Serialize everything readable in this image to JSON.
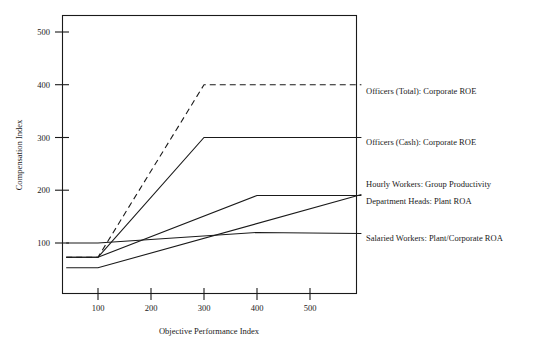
{
  "chart_data": {
    "type": "line",
    "title": "",
    "xlabel": "Objective Performance Index",
    "ylabel": "Compensation Index",
    "xlim": [
      40,
      597
    ],
    "ylim": [
      0,
      540
    ],
    "xticks": [
      100,
      200,
      300,
      400,
      500
    ],
    "xtick_labels": [
      "100",
      "200",
      "300",
      "400",
      "500"
    ],
    "yticks": [
      100,
      200,
      300,
      400,
      500
    ],
    "ytick_labels": [
      "100",
      "200",
      "300",
      "400",
      "500"
    ],
    "grid": false,
    "legend_position": "right-of-axes",
    "series": [
      {
        "name": "Officers (Total): Corporate ROE",
        "style": "dashed",
        "label": "Officers (Total): Corporate ROE",
        "x": [
          40,
          100,
          300,
          597
        ],
        "y": [
          73,
          73,
          400,
          400
        ]
      },
      {
        "name": "Officers (Cash): Corporate ROE",
        "style": "solid",
        "label": "Officers (Cash): Corporate ROE",
        "x": [
          40,
          100,
          300,
          597
        ],
        "y": [
          73,
          73,
          300,
          300
        ]
      },
      {
        "name": "Hourly Workers: Group Productivity",
        "style": "solid",
        "label": "Hourly Workers: Group Productivity",
        "x": [
          40,
          100,
          597
        ],
        "y": [
          53,
          53,
          192
        ]
      },
      {
        "name": "Department Heads: Plant ROA",
        "style": "solid",
        "label": "Department Heads: Plant ROA",
        "x": [
          40,
          100,
          400,
          597
        ],
        "y": [
          73,
          73,
          190,
          190
        ]
      },
      {
        "name": "Salaried Workers: Plant/Corporate ROA",
        "style": "solid",
        "label": "Salaried Workers: Plant/Corporate ROA",
        "x": [
          40,
          100,
          400,
          597
        ],
        "y": [
          100,
          100,
          120,
          118
        ]
      }
    ],
    "series_label_positions": [
      {
        "label_y": 91
      },
      {
        "label_y": 142
      },
      {
        "label_y": 184
      },
      {
        "label_y": 201
      },
      {
        "label_y": 238
      }
    ]
  },
  "colors": {
    "ink": "#1a1a1a",
    "background": "#ffffff"
  }
}
